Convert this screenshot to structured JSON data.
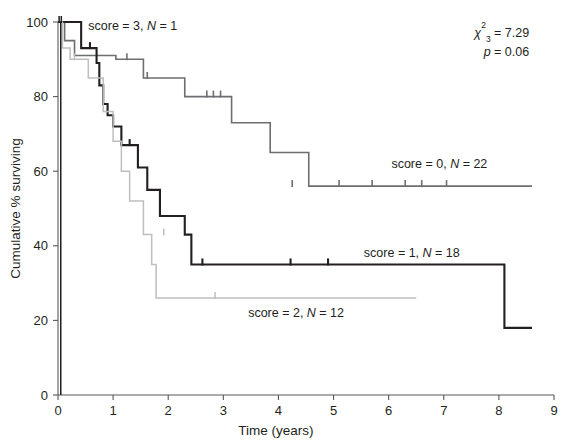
{
  "chart_data": {
    "type": "line",
    "subtype": "kaplan-meier-survival",
    "title": "",
    "xlabel": "Time (years)",
    "ylabel": "Cumulative % surviving",
    "xlim": [
      0,
      9
    ],
    "ylim": [
      0,
      100
    ],
    "xticks": [
      0,
      1,
      2,
      3,
      4,
      5,
      6,
      7,
      8,
      9
    ],
    "xtick_labels": [
      "0",
      "1",
      "2",
      "3",
      "4",
      "5",
      "6",
      "7",
      "8",
      "9"
    ],
    "yticks": [
      0,
      20,
      40,
      60,
      80,
      100
    ],
    "ytick_labels": [
      "0",
      "20",
      "40",
      "60",
      "80",
      "100"
    ],
    "grid": false,
    "legend_position": "inline-annotations",
    "annotations": [
      {
        "name": "chi-square-stat",
        "text": "χ²₃ = 7.29",
        "x": 8.55,
        "y": 97,
        "align": "end"
      },
      {
        "name": "p-value-stat",
        "text": "p = 0.06",
        "x": 8.55,
        "y": 92,
        "align": "end"
      }
    ],
    "series": [
      {
        "name": "score = 0, N = 22",
        "score": 0,
        "n": 22,
        "color": "#6d6e71",
        "width": 1.6,
        "label": "score = 0, N = 22",
        "label_x": 6.05,
        "label_y": 62,
        "label_align": "start",
        "steps": [
          [
            0.0,
            100
          ],
          [
            0.12,
            100
          ],
          [
            0.12,
            95
          ],
          [
            0.3,
            95
          ],
          [
            0.3,
            91
          ],
          [
            1.05,
            91
          ],
          [
            1.05,
            90
          ],
          [
            1.55,
            90
          ],
          [
            1.55,
            85
          ],
          [
            2.3,
            85
          ],
          [
            2.3,
            80
          ],
          [
            3.15,
            80
          ],
          [
            3.15,
            73
          ],
          [
            3.85,
            73
          ],
          [
            3.85,
            65
          ],
          [
            4.55,
            65
          ],
          [
            4.55,
            56
          ],
          [
            8.6,
            56
          ]
        ],
        "censor_times": [
          1.25,
          1.62,
          2.7,
          2.82,
          2.95,
          4.25,
          5.1,
          5.7,
          6.3,
          6.6,
          7.05
        ],
        "censor_values": [
          90,
          85,
          80,
          80,
          80,
          56,
          56,
          56,
          56,
          56,
          56
        ]
      },
      {
        "name": "score = 1, N = 18",
        "score": 1,
        "n": 18,
        "color": "#231f20",
        "width": 2.1,
        "label": "score = 1, N = 18",
        "label_x": 5.55,
        "label_y": 38,
        "label_align": "start",
        "steps": [
          [
            0.0,
            100
          ],
          [
            0.42,
            100
          ],
          [
            0.42,
            93
          ],
          [
            0.7,
            93
          ],
          [
            0.7,
            89
          ],
          [
            0.75,
            89
          ],
          [
            0.75,
            83
          ],
          [
            0.82,
            83
          ],
          [
            0.82,
            78
          ],
          [
            0.9,
            78
          ],
          [
            0.9,
            75
          ],
          [
            1.0,
            75
          ],
          [
            1.0,
            72
          ],
          [
            1.15,
            72
          ],
          [
            1.15,
            67
          ],
          [
            1.45,
            67
          ],
          [
            1.45,
            61
          ],
          [
            1.62,
            61
          ],
          [
            1.62,
            55
          ],
          [
            1.85,
            55
          ],
          [
            1.85,
            48
          ],
          [
            2.3,
            48
          ],
          [
            2.3,
            43
          ],
          [
            2.42,
            43
          ],
          [
            2.42,
            35
          ],
          [
            8.1,
            35
          ],
          [
            8.1,
            18
          ],
          [
            8.6,
            18
          ]
        ],
        "censor_times": [
          0.58,
          1.3,
          2.62,
          4.22,
          4.9
        ],
        "censor_values": [
          93,
          67,
          35,
          35,
          35
        ]
      },
      {
        "name": "score = 2, N = 12",
        "score": 2,
        "n": 12,
        "color": "#bcbec0",
        "width": 1.5,
        "label": "score = 2, N = 12",
        "label_x": 3.45,
        "label_y": 22,
        "label_align": "start",
        "steps": [
          [
            0.0,
            100
          ],
          [
            0.08,
            100
          ],
          [
            0.08,
            93
          ],
          [
            0.22,
            93
          ],
          [
            0.22,
            90
          ],
          [
            0.55,
            90
          ],
          [
            0.55,
            85
          ],
          [
            0.82,
            85
          ],
          [
            0.82,
            76
          ],
          [
            1.0,
            76
          ],
          [
            1.0,
            68
          ],
          [
            1.15,
            68
          ],
          [
            1.15,
            60
          ],
          [
            1.3,
            60
          ],
          [
            1.3,
            52
          ],
          [
            1.55,
            52
          ],
          [
            1.55,
            43
          ],
          [
            1.7,
            43
          ],
          [
            1.7,
            35
          ],
          [
            1.78,
            35
          ],
          [
            1.78,
            26
          ],
          [
            6.5,
            26
          ]
        ],
        "censor_times": [
          0.3,
          1.92,
          2.85
        ],
        "censor_values": [
          90,
          43,
          26
        ]
      },
      {
        "name": "score = 3, N = 1",
        "score": 3,
        "n": 1,
        "color": "#231f20",
        "width": 1.5,
        "label": "score = 3, N = 1",
        "label_x": 0.55,
        "label_y": 99,
        "label_align": "start",
        "steps": [
          [
            0.0,
            100
          ],
          [
            0.05,
            100
          ],
          [
            0.05,
            50
          ],
          [
            0.05,
            0
          ]
        ],
        "censor_times": [
          0.02,
          0.06
        ],
        "censor_values": [
          100,
          100
        ]
      }
    ]
  },
  "caption": {
    "partial_text": ""
  }
}
